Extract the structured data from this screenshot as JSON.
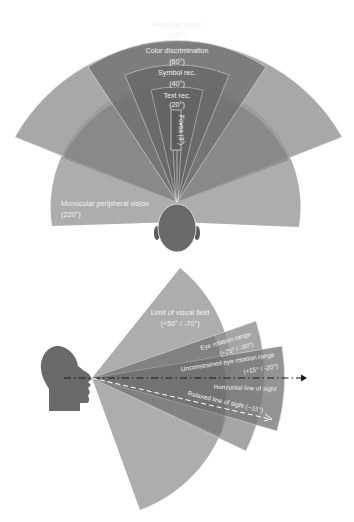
{
  "top_diagram": {
    "title": "Human horizontal field of view (top view)",
    "zones": [
      {
        "id": "binocular",
        "label": "Binocular vision",
        "angle_label": "(120°)",
        "angle_deg": 120
      },
      {
        "id": "color",
        "label": "Color discrimination",
        "angle_label": "(60°)",
        "angle_deg": 60
      },
      {
        "id": "symbol",
        "label": "Symbol rec.",
        "angle_label": "(40°)",
        "angle_deg": 40
      },
      {
        "id": "text",
        "label": "Text rec.",
        "angle_label": "(20°)",
        "angle_deg": 20
      },
      {
        "id": "fovea",
        "label": "Fovea (3°)",
        "angle_deg": 3
      },
      {
        "id": "monocular",
        "label": "Monocular peripheral vision",
        "angle_label": "(220°)",
        "angle_deg": 220
      }
    ]
  },
  "bottom_diagram": {
    "title": "Human vertical field of view (side view)",
    "zones": [
      {
        "id": "limit",
        "label": "Limit of visual field",
        "angle_label": "(+50° / -70°)",
        "up_deg": 50,
        "down_deg": -70
      },
      {
        "id": "eye-rotation",
        "label": "Eye rotation range",
        "angle_label": "(+25° / -30°)",
        "up_deg": 25,
        "down_deg": -30
      },
      {
        "id": "unconstrained",
        "label": "Unconstrained eye rotation range",
        "angle_label": "(+15° / -20°)",
        "up_deg": 15,
        "down_deg": -20
      }
    ],
    "lines": [
      {
        "id": "horizontal",
        "label": "Horizontal line of sight",
        "angle_deg": 0
      },
      {
        "id": "relaxed",
        "label": "Relaxed line of sight (~15°)",
        "angle_deg": -15
      }
    ]
  },
  "colors": {
    "light": "#a9a9a9",
    "medium": "#8e8e8e",
    "dark": "#6f6f6f",
    "head": "#6a6a6a",
    "outline": "#e6e6e6"
  }
}
